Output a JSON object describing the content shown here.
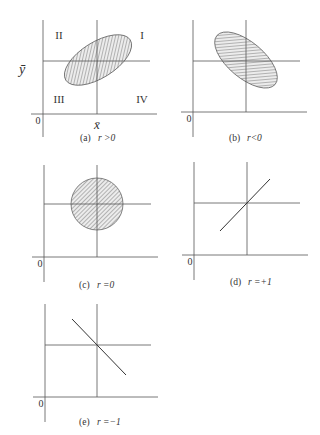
{
  "panels": [
    {
      "id": "a",
      "caption_tag": "(a)",
      "caption_expr": "r >0",
      "shape": "ellipse",
      "description": "positive correlation: ellipse tilted upward",
      "origin_label": "0",
      "x_mean_label": "x̄",
      "y_mean_label": "ȳ",
      "quadrants": {
        "I": "I",
        "II": "II",
        "III": "III",
        "IV": "IV"
      }
    },
    {
      "id": "b",
      "caption_tag": "(b)",
      "caption_expr": "r<0",
      "shape": "ellipse",
      "description": "negative correlation: ellipse tilted downward",
      "origin_label": "0"
    },
    {
      "id": "c",
      "caption_tag": "(c)",
      "caption_expr": "r =0",
      "shape": "circle",
      "description": "no correlation: circle",
      "origin_label": "0"
    },
    {
      "id": "d",
      "caption_tag": "(d)",
      "caption_expr": "r =+1",
      "shape": "line-up",
      "description": "perfect positive correlation: upward line",
      "origin_label": "0"
    },
    {
      "id": "e",
      "caption_tag": "(e)",
      "caption_expr": "r =−1",
      "shape": "line-down",
      "description": "perfect negative correlation: downward line",
      "origin_label": "0"
    }
  ],
  "colors": {
    "axis": "#555555",
    "hatch_fill": "#d8d8d8",
    "hatch_line": "#666666",
    "text": "#333333"
  }
}
